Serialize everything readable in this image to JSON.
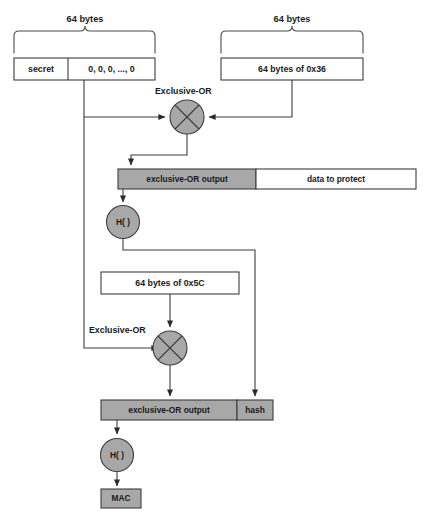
{
  "diagram": {
    "colors": {
      "gray_fill": "#a8a8a8",
      "white_fill": "#ffffff",
      "stroke": "#3d3d3d",
      "text": "#1a1a1a"
    },
    "brace_labels": {
      "left": "64 bytes",
      "right": "64 bytes"
    },
    "key_block": {
      "secret": "secret",
      "padding": "0, 0, 0, ..., 0"
    },
    "ipad_box": "64 bytes of 0x36",
    "opad_box": "64 bytes of 0x5C",
    "xor_label_top": "Exclusive-OR",
    "xor_label_bottom": "Exclusive-OR",
    "inner_bar": {
      "left": "exclusive-OR output",
      "right": "data to protect"
    },
    "outer_bar": {
      "left": "exclusive-OR output",
      "right": "hash"
    },
    "hash_fn_inner": "H( )",
    "hash_fn_outer": "H( )",
    "mac_box": "MAC"
  }
}
